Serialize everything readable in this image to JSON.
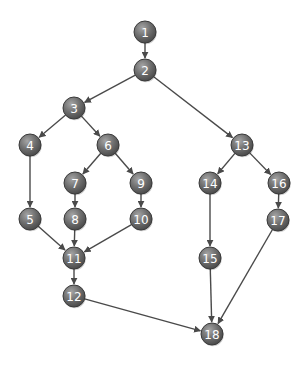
{
  "diagram": {
    "type": "directed-graph",
    "colors": {
      "background": "#ffffff",
      "node_fill_light": "#9a9a9a",
      "node_fill_dark": "#4f4f4f",
      "node_stroke": "#3a3a3a",
      "node_text": "#ffffff",
      "edge": "#4a4a4a"
    },
    "node_radius": 11,
    "nodes": [
      {
        "id": "1",
        "label": "1",
        "x": 145,
        "y": 32
      },
      {
        "id": "2",
        "label": "2",
        "x": 145,
        "y": 70
      },
      {
        "id": "3",
        "label": "3",
        "x": 74,
        "y": 108
      },
      {
        "id": "4",
        "label": "4",
        "x": 30,
        "y": 145
      },
      {
        "id": "5",
        "label": "5",
        "x": 30,
        "y": 219
      },
      {
        "id": "6",
        "label": "6",
        "x": 108,
        "y": 145
      },
      {
        "id": "7",
        "label": "7",
        "x": 75,
        "y": 183
      },
      {
        "id": "8",
        "label": "8",
        "x": 75,
        "y": 219
      },
      {
        "id": "9",
        "label": "9",
        "x": 141,
        "y": 183
      },
      {
        "id": "10",
        "label": "10",
        "x": 141,
        "y": 219
      },
      {
        "id": "11",
        "label": "11",
        "x": 74,
        "y": 258
      },
      {
        "id": "12",
        "label": "12",
        "x": 74,
        "y": 296
      },
      {
        "id": "13",
        "label": "13",
        "x": 242,
        "y": 145
      },
      {
        "id": "14",
        "label": "14",
        "x": 210,
        "y": 183
      },
      {
        "id": "15",
        "label": "15",
        "x": 210,
        "y": 258
      },
      {
        "id": "16",
        "label": "16",
        "x": 279,
        "y": 183
      },
      {
        "id": "17",
        "label": "17",
        "x": 278,
        "y": 220
      },
      {
        "id": "18",
        "label": "18",
        "x": 212,
        "y": 334
      }
    ],
    "edges": [
      {
        "from": "1",
        "to": "2"
      },
      {
        "from": "2",
        "to": "3"
      },
      {
        "from": "2",
        "to": "13"
      },
      {
        "from": "3",
        "to": "4"
      },
      {
        "from": "3",
        "to": "6"
      },
      {
        "from": "4",
        "to": "5"
      },
      {
        "from": "6",
        "to": "7"
      },
      {
        "from": "6",
        "to": "9"
      },
      {
        "from": "7",
        "to": "8"
      },
      {
        "from": "9",
        "to": "10"
      },
      {
        "from": "5",
        "to": "11"
      },
      {
        "from": "8",
        "to": "11"
      },
      {
        "from": "10",
        "to": "11"
      },
      {
        "from": "11",
        "to": "12"
      },
      {
        "from": "12",
        "to": "18"
      },
      {
        "from": "13",
        "to": "14"
      },
      {
        "from": "13",
        "to": "16"
      },
      {
        "from": "14",
        "to": "15"
      },
      {
        "from": "16",
        "to": "17"
      },
      {
        "from": "15",
        "to": "18"
      },
      {
        "from": "17",
        "to": "18"
      }
    ]
  }
}
